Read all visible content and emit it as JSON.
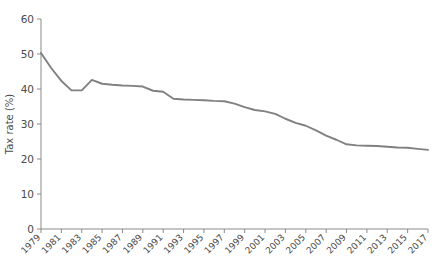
{
  "title_remnant": "",
  "chart_data": {
    "type": "line",
    "title": "",
    "xlabel": "",
    "ylabel": "Tax rate (%)",
    "ylim": [
      0,
      60
    ],
    "yticks": [
      0,
      10,
      20,
      30,
      40,
      50,
      60
    ],
    "xlim": [
      1979,
      2017
    ],
    "xticks": [
      1979,
      1981,
      1983,
      1985,
      1987,
      1989,
      1991,
      1993,
      1995,
      1997,
      1999,
      2001,
      2003,
      2005,
      2007,
      2009,
      2011,
      2013,
      2015,
      2017
    ],
    "grid": false,
    "legend": false,
    "line_color": "#808080",
    "x": [
      1979,
      1980,
      1981,
      1982,
      1983,
      1984,
      1985,
      1986,
      1987,
      1988,
      1989,
      1990,
      1991,
      1992,
      1993,
      1994,
      1995,
      1996,
      1997,
      1998,
      1999,
      2000,
      2001,
      2002,
      2003,
      2004,
      2005,
      2006,
      2007,
      2008,
      2009,
      2010,
      2011,
      2012,
      2013,
      2014,
      2015,
      2016,
      2017
    ],
    "values": [
      50.3,
      46.0,
      42.3,
      39.6,
      39.6,
      42.6,
      41.5,
      41.2,
      41.0,
      40.9,
      40.7,
      39.5,
      39.2,
      37.2,
      37.0,
      36.9,
      36.8,
      36.6,
      36.5,
      35.8,
      34.8,
      34.0,
      33.6,
      32.9,
      31.5,
      30.3,
      29.5,
      28.2,
      26.7,
      25.5,
      24.2,
      23.9,
      23.8,
      23.7,
      23.5,
      23.3,
      23.2,
      22.9,
      22.6
    ],
    "series_name": "Tax rate"
  }
}
